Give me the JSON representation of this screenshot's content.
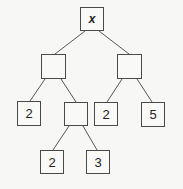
{
  "diagram": {
    "type": "expression-tree",
    "nodes": [
      {
        "id": "root",
        "label": "x",
        "x": 80,
        "y": 7,
        "w": 24,
        "h": 24
      },
      {
        "id": "left",
        "label": "",
        "x": 41,
        "y": 54,
        "w": 25,
        "h": 25
      },
      {
        "id": "right",
        "label": "",
        "x": 117,
        "y": 54,
        "w": 25,
        "h": 25
      },
      {
        "id": "left-left",
        "label": "2",
        "x": 17,
        "y": 101,
        "w": 24,
        "h": 25
      },
      {
        "id": "left-right",
        "label": "",
        "x": 64,
        "y": 102,
        "w": 24,
        "h": 24
      },
      {
        "id": "right-left",
        "label": "2",
        "x": 94,
        "y": 102,
        "w": 24,
        "h": 24
      },
      {
        "id": "right-right",
        "label": "5",
        "x": 141,
        "y": 102,
        "w": 24,
        "h": 25
      },
      {
        "id": "lr-left",
        "label": "2",
        "x": 40,
        "y": 150,
        "w": 24,
        "h": 24
      },
      {
        "id": "lr-right",
        "label": "3",
        "x": 86,
        "y": 150,
        "w": 24,
        "h": 24
      }
    ],
    "edges": [
      [
        "root",
        "left"
      ],
      [
        "root",
        "right"
      ],
      [
        "left",
        "left-left"
      ],
      [
        "left",
        "left-right"
      ],
      [
        "right",
        "right-left"
      ],
      [
        "right",
        "right-right"
      ],
      [
        "left-right",
        "lr-left"
      ],
      [
        "left-right",
        "lr-right"
      ]
    ]
  }
}
